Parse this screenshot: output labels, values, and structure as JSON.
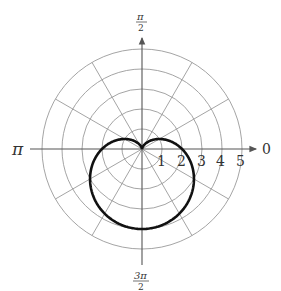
{
  "chart_data": {
    "type": "line",
    "subtype": "polar",
    "title": "",
    "equation": "r = 2 - 2 sin(theta)",
    "curve_name": "cardioid",
    "angle_labels": {
      "right": "0",
      "top": "π/2",
      "left": "π",
      "bottom": "3π/2"
    },
    "radial_ticks": [
      1,
      2,
      3,
      4,
      5
    ],
    "radial_range": [
      0,
      5
    ],
    "angular_gridlines_deg": [
      0,
      30,
      60,
      90,
      120,
      150,
      180,
      210,
      240,
      270,
      300,
      330
    ],
    "grid": true,
    "series": [
      {
        "name": "r = 2 - 2sinθ",
        "theta_deg": [
          0,
          30,
          60,
          90,
          120,
          150,
          180,
          210,
          240,
          270,
          300,
          330,
          360
        ],
        "r": [
          2,
          1,
          0.27,
          0,
          0.27,
          1,
          2,
          3,
          3.73,
          4,
          3.73,
          3,
          2
        ]
      }
    ],
    "colors": {
      "curve": "#111111",
      "grid": "#9a9a9a",
      "axis": "#555555"
    }
  },
  "labels": {
    "zero": "0",
    "pi": "π",
    "half_pi_num": "π",
    "half_pi_den": "2",
    "three_half_pi_num": "3π",
    "three_half_pi_den": "2",
    "r1": "1",
    "r2": "2",
    "r3": "3",
    "r4": "4",
    "r5": "5"
  }
}
